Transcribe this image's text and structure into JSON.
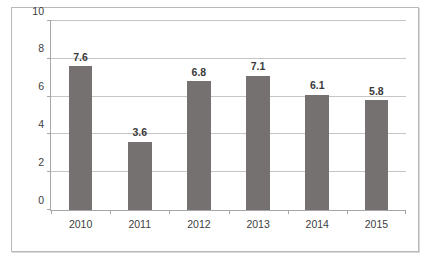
{
  "chart_data": {
    "type": "bar",
    "title": "",
    "subtitle": "",
    "xlabel": "",
    "ylabel": "",
    "categories": [
      "2010",
      "2011",
      "2012",
      "2013",
      "2014",
      "2015"
    ],
    "values": [
      7.6,
      3.6,
      6.8,
      7.1,
      6.1,
      5.8
    ],
    "data_labels": [
      "7.6",
      "3.6",
      "6.8",
      "7.1",
      "6.1",
      "5.8"
    ],
    "ylim": [
      0,
      10
    ],
    "ytick_values": [
      0,
      2,
      4,
      6,
      8,
      10
    ],
    "ytick_labels": [
      "0",
      "2",
      "4",
      "6",
      "8",
      "10"
    ],
    "ytick_step": 2,
    "grid": true,
    "grid_axis": "y",
    "legend": false,
    "legend_position": "none",
    "series": [
      {
        "name": "",
        "values": [
          7.6,
          3.6,
          6.8,
          7.1,
          6.1,
          5.8
        ],
        "color": "#767171"
      }
    ]
  },
  "colors": {
    "bar": "#767171",
    "gridline": "#c5c5c5",
    "axis": "#a6a6a6",
    "frame": "#b8b8b8",
    "plot_background": "#ffffff",
    "tick_label": "#404040",
    "data_label": "#3a3a3a"
  },
  "caption": {
    "text": "Figure 4.1 Sample年 chart",
    "visible_fragment": ""
  }
}
